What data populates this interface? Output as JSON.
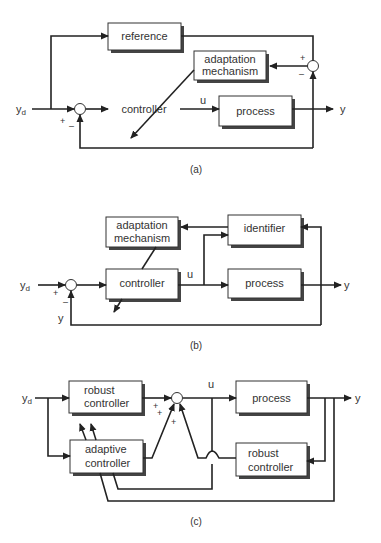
{
  "diagrams": {
    "a": {
      "caption": "(a)",
      "blocks": {
        "reference": "reference",
        "adaptation_line1": "adaptation",
        "adaptation_line2": "mechanism",
        "controller": "controller",
        "process": "process"
      },
      "signals": {
        "input": "y",
        "input_sub": "d",
        "control": "u",
        "output": "y"
      },
      "signs": {
        "sum1_plus": "+",
        "sum1_minus": "–",
        "sum2_plus": "+",
        "sum2_minus": "–"
      }
    },
    "b": {
      "caption": "(b)",
      "blocks": {
        "adaptation_line1": "adaptation",
        "adaptation_line2": "mechanism",
        "identifier": "identifier",
        "controller": "controller",
        "process": "process"
      },
      "signals": {
        "input": "y",
        "input_sub": "d",
        "control": "u",
        "output": "y",
        "feedback": "y"
      },
      "signs": {
        "sum_plus": "+",
        "sum_minus": "–"
      }
    },
    "c": {
      "caption": "(c)",
      "blocks": {
        "robust1_line1": "robust",
        "robust1_line2": "controller",
        "adaptive_line1": "adaptive",
        "adaptive_line2": "controller",
        "process": "process",
        "robust2_line1": "robust",
        "robust2_line2": "controller"
      },
      "signals": {
        "input": "y",
        "input_sub": "d",
        "control": "u",
        "output": "y"
      },
      "signs": {
        "plus1": "+",
        "plus2": "+",
        "plus3": "+"
      }
    }
  }
}
